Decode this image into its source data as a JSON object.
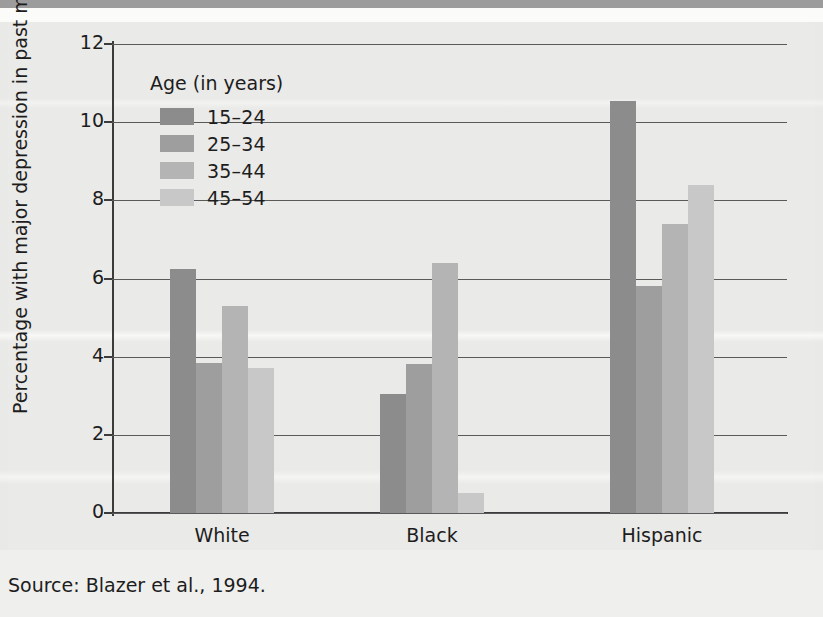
{
  "figure": {
    "source_note": "Source: Blazer et al., 1994."
  },
  "chart_data": {
    "type": "bar",
    "title": "",
    "xlabel": "",
    "ylabel": "Percentage with major depression in past month",
    "ylim": [
      0,
      12
    ],
    "ytick_labels": [
      "12",
      "10",
      "8",
      "6",
      "4",
      "2",
      "0"
    ],
    "ytick_values": [
      12,
      10,
      8,
      6,
      4,
      2,
      0
    ],
    "grid": true,
    "categories": [
      "White",
      "Black",
      "Hispanic"
    ],
    "legend_title": "Age (in years)",
    "legend_position": "inside-top-left",
    "series": [
      {
        "name": "15–24",
        "color": "#8c8c8c",
        "values": [
          6.25,
          3.05,
          10.55
        ]
      },
      {
        "name": "25–34",
        "color": "#9e9e9e",
        "values": [
          3.85,
          3.8,
          5.8
        ]
      },
      {
        "name": "35–44",
        "color": "#b4b4b4",
        "values": [
          5.3,
          6.4,
          7.4
        ]
      },
      {
        "name": "45–54",
        "color": "#c8c8c8",
        "values": [
          3.7,
          0.5,
          8.4
        ]
      }
    ]
  }
}
